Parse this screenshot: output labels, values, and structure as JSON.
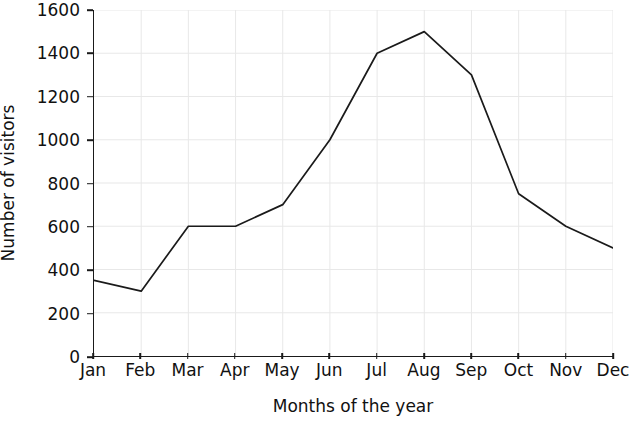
{
  "chart_data": {
    "type": "line",
    "title": "",
    "xlabel": "Months of the year",
    "ylabel": "Number of visitors",
    "categories": [
      "Jan",
      "Feb",
      "Mar",
      "Apr",
      "May",
      "Jun",
      "Jul",
      "Aug",
      "Sep",
      "Oct",
      "Nov",
      "Dec"
    ],
    "values": [
      350,
      300,
      600,
      600,
      700,
      1000,
      1400,
      1500,
      1300,
      750,
      600,
      500
    ],
    "series": [
      {
        "name": "Number of visitors",
        "values": [
          350,
          300,
          600,
          600,
          700,
          1000,
          1400,
          1500,
          1300,
          750,
          600,
          500
        ]
      }
    ],
    "ylim": [
      0,
      1600
    ],
    "yticks": [
      0,
      200,
      400,
      600,
      800,
      1000,
      1200,
      1400,
      1600
    ],
    "ytick_labels": [
      "0",
      "200",
      "400",
      "600",
      "800",
      "1000",
      "1200",
      "1400",
      "1600"
    ],
    "grid": "horizontal-and-vertical-light",
    "legend": "none",
    "line_color": "#1a1a1a",
    "grid_color": "#e8e8e8",
    "axis_color": "#1a1a1a",
    "background_color": "#ffffff"
  }
}
